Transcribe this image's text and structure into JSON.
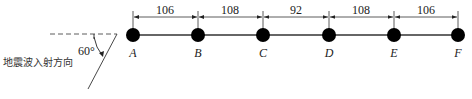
{
  "diagram": {
    "nodes": [
      {
        "id": "A",
        "label": "A",
        "x": 133
      },
      {
        "id": "B",
        "label": "B",
        "x": 198
      },
      {
        "id": "C",
        "label": "C",
        "x": 263
      },
      {
        "id": "D",
        "label": "D",
        "x": 329
      },
      {
        "id": "E",
        "label": "E",
        "x": 394
      },
      {
        "id": "F",
        "label": "F",
        "x": 458
      }
    ],
    "spacings": [
      "106",
      "108",
      "92",
      "108",
      "106"
    ],
    "incidence": {
      "angle_label": "60°",
      "direction_label": "地震波入射方向"
    },
    "colors": {
      "line": "#222222",
      "node": "#000000"
    }
  }
}
